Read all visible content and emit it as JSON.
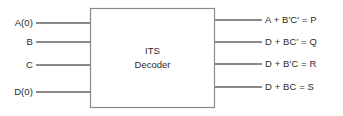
{
  "diagram": {
    "kind": "block-diagram",
    "title_line_1": "ITS",
    "title_line_2": "Decoder",
    "stroke_color": "#8a8a8a",
    "text_color": "#2b2b2b",
    "background_color": "#ffffff",
    "block": {
      "x": 90,
      "y": 8,
      "width": 125,
      "height": 100
    },
    "inputs": [
      {
        "label": "A(0)",
        "y": 23
      },
      {
        "label": "B",
        "y": 42
      },
      {
        "label": "C",
        "y": 65
      },
      {
        "label": "D(0)",
        "y": 92
      }
    ],
    "outputs": [
      {
        "label": "A + B′C′ = P",
        "y": 20
      },
      {
        "label": "D + BC′ = Q",
        "y": 42
      },
      {
        "label": "D + B′C = R",
        "y": 64
      },
      {
        "label": "D + BC = S",
        "y": 87
      }
    ]
  }
}
